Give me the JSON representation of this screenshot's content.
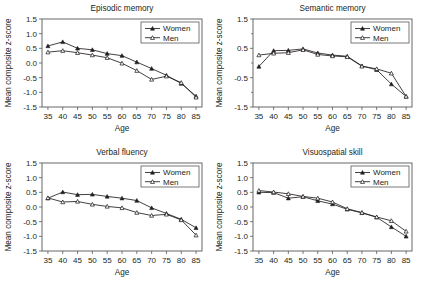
{
  "figure": {
    "width": 421,
    "height": 288,
    "background": "#ffffff",
    "ink_color": "#231f20",
    "axis_color": "#58585b"
  },
  "shared": {
    "xlabel": "Age",
    "ylabel": "Mean composite z-score",
    "legend_entries": [
      {
        "label": "Women",
        "marker": "filled-triangle"
      },
      {
        "label": "Men",
        "marker": "open-triangle"
      }
    ],
    "x_tick_labels": [
      "35",
      "40",
      "45",
      "50",
      "55",
      "60",
      "65",
      "70",
      "75",
      "80",
      "85"
    ]
  },
  "chart_data": [
    {
      "id": "episodic-memory",
      "type": "line",
      "title": "Episodic memory",
      "xlabel": "Age",
      "ylabel": "Mean composite z-score",
      "x": [
        35,
        40,
        45,
        50,
        55,
        60,
        65,
        70,
        75,
        80,
        85
      ],
      "xlim": [
        33,
        87
      ],
      "ylim": [
        -1.5,
        1.5
      ],
      "y_tick_labels": [
        "1.5",
        "1.0",
        "0.5",
        "0.0",
        "-0.5",
        "-1.0",
        "-1.5"
      ],
      "y_ticks": [
        1.5,
        1.0,
        0.5,
        0.0,
        -0.5,
        -1.0,
        -1.5
      ],
      "grid": false,
      "legend_position": "top-right",
      "series": [
        {
          "name": "Women",
          "marker": "filled-triangle",
          "values": [
            0.58,
            0.72,
            0.5,
            0.45,
            0.32,
            0.25,
            0.03,
            -0.19,
            -0.42,
            -0.7,
            -1.13
          ]
        },
        {
          "name": "Men",
          "marker": "open-triangle",
          "values": [
            0.37,
            0.42,
            0.35,
            0.27,
            0.18,
            -0.01,
            -0.26,
            -0.56,
            -0.45,
            -0.67,
            -1.17
          ]
        }
      ]
    },
    {
      "id": "semantic-memory",
      "type": "line",
      "title": "Semantic memory",
      "xlabel": "Age",
      "ylabel": "Mean composite z-score",
      "x": [
        35,
        40,
        45,
        50,
        55,
        60,
        65,
        70,
        75,
        80,
        85
      ],
      "xlim": [
        33,
        87
      ],
      "ylim": [
        -1.5,
        1.5
      ],
      "y_tick_labels": [
        "1.5",
        "0.5",
        "-0.5",
        "-1.5"
      ],
      "y_ticks": [
        1.5,
        0.5,
        -0.5,
        -1.5
      ],
      "grid": false,
      "legend_position": "top-right",
      "series": [
        {
          "name": "Women",
          "marker": "filled-triangle",
          "values": [
            -0.12,
            0.42,
            0.43,
            0.48,
            0.34,
            0.27,
            0.23,
            -0.1,
            -0.23,
            -0.72,
            -1.14
          ]
        },
        {
          "name": "Men",
          "marker": "open-triangle",
          "values": [
            0.27,
            0.33,
            0.35,
            0.45,
            0.29,
            0.24,
            0.21,
            -0.11,
            -0.2,
            -0.35,
            -1.14
          ]
        }
      ]
    },
    {
      "id": "verbal-fluency",
      "type": "line",
      "title": "Verbal fluency",
      "xlabel": "Age",
      "ylabel": "Mean composite z-score",
      "x": [
        35,
        40,
        45,
        50,
        55,
        60,
        65,
        70,
        75,
        80,
        85
      ],
      "xlim": [
        33,
        87
      ],
      "ylim": [
        -1.5,
        1.5
      ],
      "y_tick_labels": [
        "1.5",
        "1.0",
        "0.5",
        "0.0",
        "-0.5",
        "-1.0",
        "-1.5"
      ],
      "y_ticks": [
        1.5,
        1.0,
        0.5,
        0.0,
        -0.5,
        -1.0,
        -1.5
      ],
      "grid": false,
      "legend_position": "top-right",
      "series": [
        {
          "name": "Women",
          "marker": "filled-triangle",
          "values": [
            0.3,
            0.51,
            0.42,
            0.43,
            0.36,
            0.3,
            0.22,
            -0.03,
            -0.22,
            -0.42,
            -0.71
          ]
        },
        {
          "name": "Men",
          "marker": "open-triangle",
          "values": [
            0.31,
            0.17,
            0.19,
            0.09,
            0.02,
            -0.03,
            -0.19,
            -0.29,
            -0.25,
            -0.44,
            -0.96
          ]
        }
      ]
    },
    {
      "id": "visuospatial-skill",
      "type": "line",
      "title": "Visuospatial skill",
      "xlabel": "Age",
      "ylabel": "Mean composite z-score",
      "x": [
        35,
        40,
        45,
        50,
        55,
        60,
        65,
        70,
        75,
        80,
        85
      ],
      "xlim": [
        33,
        87
      ],
      "ylim": [
        -1.5,
        1.5
      ],
      "y_tick_labels": [
        "1.5",
        "1.0",
        "0.5",
        "0.0",
        "-0.5",
        "-1.0",
        "-1.5"
      ],
      "y_ticks": [
        1.5,
        1.0,
        0.5,
        0.0,
        -0.5,
        -1.0,
        -1.5
      ],
      "grid": false,
      "legend_position": "top-right",
      "series": [
        {
          "name": "Women",
          "marker": "filled-triangle",
          "values": [
            0.5,
            0.49,
            0.3,
            0.35,
            0.21,
            0.1,
            -0.08,
            -0.2,
            -0.35,
            -0.68,
            -1.0
          ]
        },
        {
          "name": "Men",
          "marker": "open-triangle",
          "values": [
            0.56,
            0.51,
            0.45,
            0.36,
            0.3,
            0.17,
            -0.06,
            -0.19,
            -0.34,
            -0.47,
            -0.83
          ]
        }
      ]
    }
  ]
}
